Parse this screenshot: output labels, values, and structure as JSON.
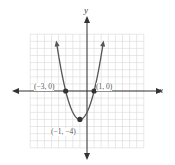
{
  "chart_data": {
    "type": "line",
    "title": "",
    "function": "y = x^2 + 2x - 3",
    "xlabel": "x",
    "ylabel": "y",
    "xlim": [
      -8,
      8
    ],
    "ylim": [
      -8,
      8
    ],
    "grid": true,
    "series": [
      {
        "name": "parabola",
        "x": [
          -4.3,
          -4,
          -3,
          -2,
          -1,
          0,
          1,
          2,
          2.3
        ],
        "values": [
          3.89,
          5,
          0,
          -3,
          -4,
          -3,
          0,
          5,
          6.89
        ]
      }
    ],
    "points": [
      {
        "x": -3,
        "y": 0,
        "label": "(−3, 0)"
      },
      {
        "x": 1,
        "y": 0,
        "label": "(1, 0)"
      },
      {
        "x": -1,
        "y": -4,
        "label": "(−1, −4)"
      }
    ],
    "colors": {
      "curve": "#555555",
      "axis": "#333333",
      "grid": "#d8d8d8",
      "point": "#333333"
    }
  },
  "labels": {
    "x_axis": "x",
    "y_axis": "y",
    "p1": "(−3, 0)",
    "p2": "(1, 0)",
    "vertex": "(−1, −4)"
  }
}
